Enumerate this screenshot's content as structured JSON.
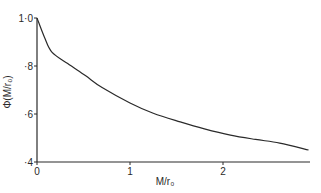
{
  "chart_data": {
    "type": "line",
    "title": "",
    "xlabel": "M/r₀",
    "ylabel": "Φ(M/r₀)",
    "xlim": [
      0,
      2.92
    ],
    "ylim": [
      0.4,
      1.0
    ],
    "x_ticks": [
      0,
      1,
      2
    ],
    "x_tick_labels": [
      "0",
      "1",
      "2"
    ],
    "y_ticks": [
      0.4,
      0.6,
      0.8,
      1.0
    ],
    "y_tick_labels": [
      "·4",
      "·6",
      "·8",
      "1·0"
    ],
    "grid": false,
    "legend": null,
    "series": [
      {
        "name": "Φ(M/r₀)",
        "x": [
          0,
          0.08,
          0.16,
          0.33,
          0.52,
          0.7,
          1.0,
          1.25,
          1.54,
          1.8,
          2.08,
          2.35,
          2.61,
          2.92
        ],
        "values": [
          1.0,
          0.92,
          0.858,
          0.81,
          0.76,
          0.71,
          0.646,
          0.603,
          0.567,
          0.538,
          0.512,
          0.494,
          0.479,
          0.45
        ]
      }
    ]
  },
  "colors": {
    "line": "#2a2a2a",
    "background": "#ffffff"
  }
}
